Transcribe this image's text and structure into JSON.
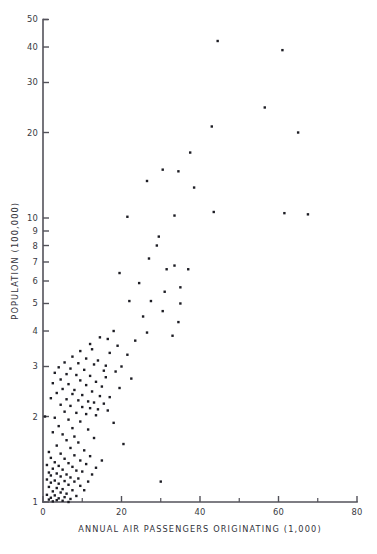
{
  "chart_data": {
    "type": "scatter",
    "title": "",
    "subtitle": "",
    "xlabel": "ANNUAL AIR PASSENGERS ORIGINATING (1,000)",
    "ylabel": "POPULATION (100,000)",
    "xscale": "linear",
    "yscale": "log",
    "xlim": [
      0,
      80
    ],
    "ylim": [
      1,
      50
    ],
    "grid": false,
    "legend": null,
    "xticks": [
      0,
      20,
      40,
      60,
      80
    ],
    "xticklabels": [
      "0",
      "20",
      "40",
      "60",
      "80"
    ],
    "xminorticks": [
      10,
      30,
      50,
      70
    ],
    "yticks": [
      1,
      2,
      3,
      4,
      5,
      6,
      7,
      8,
      9,
      10,
      20,
      30,
      40,
      50
    ],
    "yticklabels": [
      "1",
      "2",
      "3",
      "4",
      "5",
      "6",
      "7",
      "8",
      "9",
      "10",
      "20",
      "30",
      "40",
      "50"
    ],
    "marker": "square",
    "marker_size": 2.4,
    "marker_color": "#1d1d24",
    "point_count": 168,
    "points": [
      [
        44.5,
        42.0
      ],
      [
        61.0,
        39.0
      ],
      [
        56.5,
        24.5
      ],
      [
        43.0,
        21.0
      ],
      [
        65.0,
        20.0
      ],
      [
        37.5,
        17.0
      ],
      [
        30.5,
        14.8
      ],
      [
        34.5,
        14.6
      ],
      [
        26.5,
        13.5
      ],
      [
        38.5,
        12.8
      ],
      [
        43.5,
        10.5
      ],
      [
        61.5,
        10.4
      ],
      [
        67.5,
        10.3
      ],
      [
        33.5,
        10.2
      ],
      [
        21.5,
        10.1
      ],
      [
        29.5,
        8.6
      ],
      [
        29.0,
        8.0
      ],
      [
        27.0,
        7.2
      ],
      [
        33.5,
        6.8
      ],
      [
        31.5,
        6.6
      ],
      [
        37.0,
        6.6
      ],
      [
        19.5,
        6.4
      ],
      [
        24.5,
        5.9
      ],
      [
        35.0,
        5.7
      ],
      [
        31.0,
        5.5
      ],
      [
        22.0,
        5.1
      ],
      [
        27.5,
        5.1
      ],
      [
        35.0,
        5.0
      ],
      [
        30.5,
        4.7
      ],
      [
        25.5,
        4.5
      ],
      [
        34.5,
        4.3
      ],
      [
        18.0,
        4.0
      ],
      [
        26.5,
        3.95
      ],
      [
        33.0,
        3.85
      ],
      [
        14.5,
        3.8
      ],
      [
        16.5,
        3.75
      ],
      [
        23.5,
        3.7
      ],
      [
        12.0,
        3.6
      ],
      [
        19.0,
        3.55
      ],
      [
        12.5,
        3.45
      ],
      [
        9.5,
        3.4
      ],
      [
        17.0,
        3.35
      ],
      [
        21.5,
        3.3
      ],
      [
        7.5,
        3.25
      ],
      [
        11.0,
        3.2
      ],
      [
        14.0,
        3.15
      ],
      [
        5.5,
        3.1
      ],
      [
        9.0,
        3.08
      ],
      [
        13.0,
        3.05
      ],
      [
        16.0,
        3.02
      ],
      [
        20.0,
        3.0
      ],
      [
        4.0,
        2.98
      ],
      [
        7.0,
        2.95
      ],
      [
        10.5,
        2.92
      ],
      [
        15.5,
        2.9
      ],
      [
        18.5,
        2.88
      ],
      [
        3.0,
        2.85
      ],
      [
        6.0,
        2.82
      ],
      [
        8.5,
        2.8
      ],
      [
        12.0,
        2.78
      ],
      [
        16.0,
        2.75
      ],
      [
        22.5,
        2.72
      ],
      [
        4.5,
        2.7
      ],
      [
        9.5,
        2.68
      ],
      [
        13.5,
        2.65
      ],
      [
        2.5,
        2.62
      ],
      [
        6.5,
        2.6
      ],
      [
        11.0,
        2.58
      ],
      [
        15.0,
        2.55
      ],
      [
        19.5,
        2.52
      ],
      [
        5.0,
        2.5
      ],
      [
        8.0,
        2.48
      ],
      [
        12.5,
        2.45
      ],
      [
        3.5,
        2.42
      ],
      [
        7.5,
        2.4
      ],
      [
        10.0,
        2.38
      ],
      [
        14.5,
        2.36
      ],
      [
        17.0,
        2.34
      ],
      [
        2.0,
        2.32
      ],
      [
        6.0,
        2.3
      ],
      [
        9.0,
        2.28
      ],
      [
        11.5,
        2.26
      ],
      [
        13.0,
        2.24
      ],
      [
        15.5,
        2.22
      ],
      [
        4.5,
        2.2
      ],
      [
        7.0,
        2.18
      ],
      [
        10.0,
        2.16
      ],
      [
        12.0,
        2.14
      ],
      [
        14.0,
        2.12
      ],
      [
        16.5,
        2.1
      ],
      [
        5.5,
        2.08
      ],
      [
        8.5,
        2.06
      ],
      [
        11.0,
        2.04
      ],
      [
        13.5,
        2.02
      ],
      [
        0.5,
        2.0
      ],
      [
        3.0,
        1.98
      ],
      [
        6.5,
        1.95
      ],
      [
        9.5,
        1.92
      ],
      [
        18.0,
        1.9
      ],
      [
        4.0,
        1.85
      ],
      [
        7.5,
        1.82
      ],
      [
        11.5,
        1.8
      ],
      [
        2.5,
        1.76
      ],
      [
        5.0,
        1.73
      ],
      [
        8.0,
        1.7
      ],
      [
        13.0,
        1.68
      ],
      [
        6.0,
        1.65
      ],
      [
        9.0,
        1.62
      ],
      [
        20.5,
        1.6
      ],
      [
        3.5,
        1.58
      ],
      [
        7.0,
        1.55
      ],
      [
        10.5,
        1.52
      ],
      [
        1.5,
        1.5
      ],
      [
        4.5,
        1.48
      ],
      [
        8.0,
        1.46
      ],
      [
        12.0,
        1.45
      ],
      [
        2.0,
        1.43
      ],
      [
        5.5,
        1.42
      ],
      [
        9.5,
        1.4
      ],
      [
        15.0,
        1.4
      ],
      [
        3.0,
        1.38
      ],
      [
        6.5,
        1.37
      ],
      [
        11.0,
        1.36
      ],
      [
        1.0,
        1.35
      ],
      [
        4.0,
        1.34
      ],
      [
        7.5,
        1.33
      ],
      [
        13.5,
        1.32
      ],
      [
        2.5,
        1.31
      ],
      [
        5.0,
        1.3
      ],
      [
        8.5,
        1.29
      ],
      [
        10.0,
        1.28
      ],
      [
        1.5,
        1.27
      ],
      [
        3.5,
        1.26
      ],
      [
        6.0,
        1.25
      ],
      [
        12.5,
        1.25
      ],
      [
        2.0,
        1.24
      ],
      [
        4.5,
        1.23
      ],
      [
        7.0,
        1.22
      ],
      [
        9.0,
        1.21
      ],
      [
        1.0,
        1.2
      ],
      [
        3.0,
        1.19
      ],
      [
        5.5,
        1.185
      ],
      [
        8.0,
        1.18
      ],
      [
        11.5,
        1.18
      ],
      [
        30.0,
        1.18
      ],
      [
        2.0,
        1.17
      ],
      [
        4.0,
        1.16
      ],
      [
        6.5,
        1.15
      ],
      [
        9.5,
        1.14
      ],
      [
        1.5,
        1.13
      ],
      [
        3.5,
        1.12
      ],
      [
        5.0,
        1.11
      ],
      [
        7.5,
        1.1
      ],
      [
        10.5,
        1.1
      ],
      [
        2.5,
        1.09
      ],
      [
        4.5,
        1.08
      ],
      [
        6.0,
        1.07
      ],
      [
        1.0,
        1.06
      ],
      [
        3.0,
        1.055
      ],
      [
        8.5,
        1.05
      ],
      [
        5.5,
        1.04
      ],
      [
        2.0,
        1.035
      ],
      [
        4.0,
        1.03
      ],
      [
        7.0,
        1.025
      ],
      [
        1.5,
        1.02
      ],
      [
        3.5,
        1.015
      ],
      [
        5.0,
        1.01
      ],
      [
        2.5,
        1.005
      ],
      [
        6.5,
        1.0
      ]
    ]
  }
}
